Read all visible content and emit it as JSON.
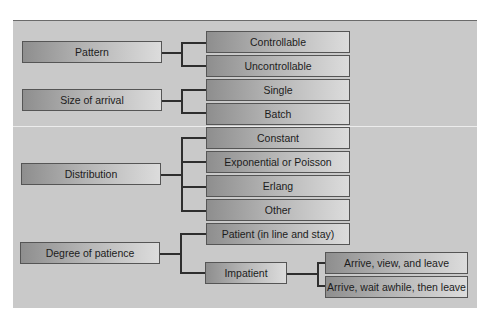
{
  "diagram": {
    "categories": [
      {
        "label": "Pattern",
        "options": [
          "Controllable",
          "Uncontrollable"
        ]
      },
      {
        "label": "Size of arrival",
        "options": [
          "Single",
          "Batch"
        ]
      },
      {
        "label": "Distribution",
        "options": [
          "Constant",
          "Exponential or Poisson",
          "Erlang",
          "Other"
        ]
      },
      {
        "label": "Degree of patience",
        "options": [
          "Patient (in line and stay)",
          "Impatient"
        ],
        "sub": {
          "parent": "Impatient",
          "options": [
            "Arrive, view, and leave",
            "Arrive, wait awhile, then leave"
          ]
        }
      }
    ]
  }
}
